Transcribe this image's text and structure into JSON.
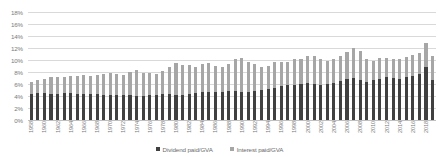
{
  "chart_data": {
    "type": "bar",
    "title": "",
    "subtitle": "",
    "xlabel": "",
    "ylabel": "",
    "stacked": true,
    "grid": true,
    "legend_position": "bottom",
    "ylim": [
      0,
      18
    ],
    "ytick_labels": [
      "18%",
      "16%",
      "14%",
      "12%",
      "10%",
      "8%",
      "6%",
      "4%",
      "2%",
      "0%"
    ],
    "ytick_values": [
      18,
      16,
      14,
      12,
      10,
      8,
      6,
      4,
      2,
      0
    ],
    "categories": [
      "1958",
      "1959",
      "1960",
      "1961",
      "1962",
      "1963",
      "1964",
      "1965",
      "1966",
      "1967",
      "1968",
      "1969",
      "1970",
      "1971",
      "1972",
      "1973",
      "1974",
      "1975",
      "1976",
      "1977",
      "1978",
      "1979",
      "1980",
      "1981",
      "1982",
      "1983",
      "1984",
      "1985",
      "1986",
      "1987",
      "1988",
      "1989",
      "1990",
      "1991",
      "1992",
      "1993",
      "1994",
      "1995",
      "1996",
      "1997",
      "1998",
      "1999",
      "2000",
      "2001",
      "2002",
      "2003",
      "2004",
      "2005",
      "2006",
      "2007",
      "2008",
      "2009",
      "2010",
      "2011",
      "2012",
      "2013",
      "2014",
      "2015",
      "2016",
      "2017",
      "2018",
      "2019"
    ],
    "xtick_labels_shown": [
      "1958",
      "1960",
      "1962",
      "1964",
      "1966",
      "1968",
      "1970",
      "1972",
      "1974",
      "1976",
      "1978",
      "1980",
      "1982",
      "1984",
      "1986",
      "1988",
      "1990",
      "1992",
      "1994",
      "1996",
      "1998",
      "2000",
      "2002",
      "2004",
      "2006",
      "2008",
      "2010",
      "2012",
      "2014",
      "2016",
      "2018"
    ],
    "series": [
      {
        "name": "Dividend paid/GVA",
        "color": "#404040",
        "values": [
          4.4,
          4.5,
          4.5,
          4.4,
          4.4,
          4.5,
          4.5,
          4.4,
          4.3,
          4.3,
          4.3,
          4.2,
          4.1,
          4.2,
          4.2,
          4.1,
          4.0,
          4.0,
          4.1,
          4.2,
          4.3,
          4.3,
          4.2,
          4.2,
          4.3,
          4.5,
          4.6,
          4.7,
          4.6,
          4.7,
          4.8,
          4.8,
          4.7,
          4.7,
          4.8,
          5.0,
          5.2,
          5.4,
          5.6,
          5.8,
          5.9,
          6.0,
          6.1,
          6.0,
          5.9,
          6.0,
          6.2,
          6.5,
          6.8,
          7.0,
          6.6,
          6.3,
          6.6,
          6.9,
          7.1,
          7.0,
          6.9,
          7.1,
          7.3,
          7.6,
          8.9,
          6.6
        ]
      },
      {
        "name": "Interest paid/GVA",
        "color": "#a6a6a6",
        "values": [
          2.0,
          2.2,
          2.4,
          2.8,
          2.7,
          2.6,
          2.8,
          3.0,
          3.2,
          3.1,
          3.2,
          3.5,
          3.7,
          3.4,
          3.3,
          3.9,
          4.4,
          3.9,
          3.7,
          3.5,
          3.8,
          4.6,
          5.3,
          5.0,
          4.8,
          4.3,
          4.7,
          4.8,
          4.4,
          4.2,
          4.6,
          5.4,
          5.7,
          5.0,
          4.6,
          3.9,
          3.8,
          4.2,
          4.0,
          3.9,
          4.2,
          4.1,
          4.6,
          4.6,
          4.2,
          3.9,
          3.9,
          4.1,
          4.6,
          5.0,
          4.9,
          3.8,
          3.3,
          3.4,
          3.3,
          3.2,
          3.2,
          3.4,
          3.5,
          3.6,
          4.0,
          4.0
        ]
      }
    ]
  },
  "legend": {
    "entries": [
      {
        "label": "Dividend paid/GVA",
        "color": "#404040"
      },
      {
        "label": "Interest paid/GVA",
        "color": "#a6a6a6"
      }
    ]
  }
}
